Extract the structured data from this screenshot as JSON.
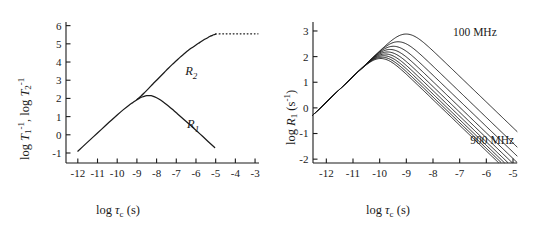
{
  "figure": {
    "type": "two-panel-scientific-plot",
    "background": "#ffffff",
    "line_color": "#1a1a1a"
  },
  "chart_data": [
    {
      "id": "left-panel",
      "type": "line",
      "title": "",
      "xlabel": "log τc (s)",
      "ylabel": "log T1-1, log T2-1",
      "xlim": [
        -12.6,
        -2.8
      ],
      "ylim": [
        -1.55,
        6.2
      ],
      "xticks": [
        -12,
        -11,
        -10,
        -9,
        -8,
        -7,
        -6,
        -5,
        -4,
        -3
      ],
      "xticklabels": [
        "-12",
        "-11",
        "-10",
        "-9",
        "-8",
        "-7",
        "-6",
        "-5",
        "-4",
        "-3"
      ],
      "yticks": [
        -1,
        0,
        1,
        2,
        3,
        4,
        5,
        6
      ],
      "yticklabels": [
        "-1",
        "0",
        "1",
        "2",
        "3",
        "4",
        "5",
        "6"
      ],
      "grid": false,
      "legend": "inline-annotations",
      "annotations": [
        {
          "text": "R2",
          "x": -6.55,
          "y": 3.28
        },
        {
          "text": "R1",
          "x": -6.45,
          "y": 0.35
        }
      ],
      "series": [
        {
          "name": "R1",
          "style": "solid",
          "x": [
            -12.0,
            -11.6,
            -11.2,
            -10.8,
            -10.4,
            -10.0,
            -9.7,
            -9.4,
            -9.2,
            -9.0,
            -8.9,
            -8.8,
            -8.7,
            -8.6,
            -8.5,
            -8.4,
            -8.3,
            -8.2,
            -8.0,
            -7.8,
            -7.6,
            -7.4,
            -7.2,
            -7.0,
            -6.6,
            -6.2,
            -5.8,
            -5.4,
            -5.05
          ],
          "y": [
            -0.9,
            -0.5,
            -0.1,
            0.3,
            0.7,
            1.09,
            1.37,
            1.63,
            1.78,
            1.93,
            1.99,
            2.05,
            2.09,
            2.13,
            2.15,
            2.16,
            2.15,
            2.13,
            2.04,
            1.91,
            1.75,
            1.58,
            1.4,
            1.21,
            0.83,
            0.44,
            0.05,
            -0.35,
            -0.7
          ]
        },
        {
          "name": "R2",
          "style": "solid",
          "x": [
            -9.0,
            -8.8,
            -8.6,
            -8.4,
            -8.2,
            -8.0,
            -7.8,
            -7.6,
            -7.4,
            -7.2,
            -7.0,
            -6.8,
            -6.6,
            -6.4,
            -6.2,
            -6.0,
            -5.8,
            -5.6,
            -5.45,
            -5.3,
            -5.2,
            -5.1,
            -5.0
          ],
          "y": [
            1.93,
            2.12,
            2.33,
            2.55,
            2.78,
            3.0,
            3.22,
            3.44,
            3.66,
            3.87,
            4.07,
            4.27,
            4.45,
            4.63,
            4.79,
            4.94,
            5.08,
            5.22,
            5.31,
            5.4,
            5.45,
            5.5,
            5.53
          ]
        },
        {
          "name": "R2-plateau",
          "style": "dotted",
          "x": [
            -5.0,
            -4.6,
            -4.2,
            -3.8,
            -3.4,
            -3.0,
            -2.85
          ],
          "y": [
            5.545,
            5.55,
            5.55,
            5.55,
            5.55,
            5.55,
            5.55
          ]
        }
      ]
    },
    {
      "id": "right-panel",
      "type": "line",
      "title": "",
      "xlabel": "log τc (s)",
      "ylabel": "log R1 (s-1)",
      "xlim": [
        -12.5,
        -4.85
      ],
      "ylim": [
        -2.15,
        3.35
      ],
      "xticks": [
        -12,
        -11,
        -10,
        -9,
        -8,
        -7,
        -6,
        -5
      ],
      "xticklabels": [
        "-12",
        "-11",
        "-10",
        "-9",
        "-8",
        "-7",
        "-6",
        "-5"
      ],
      "yticks": [
        -2,
        -1,
        0,
        1,
        2,
        3
      ],
      "yticklabels": [
        "-2",
        "-1",
        "0",
        "1",
        "2",
        "3"
      ],
      "grid": false,
      "legend": "inline-annotations",
      "annotations": [
        {
          "text": "100 MHz",
          "x": -7.25,
          "y": 2.8
        },
        {
          "text": "900 MHz",
          "x": -6.6,
          "y": -1.4
        }
      ],
      "frequencies_mhz": [
        100,
        200,
        300,
        400,
        500,
        600,
        700,
        800,
        900
      ],
      "series": [
        {
          "name": "100 MHz",
          "style": "solid",
          "peak_x": -8.0,
          "peak_y": 2.88
        },
        {
          "name": "200 MHz",
          "style": "solid",
          "peak_x": -8.3,
          "peak_y": 2.58
        },
        {
          "name": "300 MHz",
          "style": "solid",
          "peak_x": -8.48,
          "peak_y": 2.4
        },
        {
          "name": "400 MHz",
          "style": "solid",
          "peak_x": -8.6,
          "peak_y": 2.28
        },
        {
          "name": "500 MHz",
          "style": "solid",
          "peak_x": -8.7,
          "peak_y": 2.18
        },
        {
          "name": "600 MHz",
          "style": "solid",
          "peak_x": -8.78,
          "peak_y": 2.1
        },
        {
          "name": "700 MHz",
          "style": "solid",
          "peak_x": -8.84,
          "peak_y": 2.04
        },
        {
          "name": "800 MHz",
          "style": "solid",
          "peak_x": -8.9,
          "peak_y": 1.98
        },
        {
          "name": "900 MHz",
          "style": "solid",
          "peak_x": -8.95,
          "peak_y": 1.93
        }
      ]
    }
  ],
  "left": {
    "xlabel_parts": {
      "log": "log ",
      "tau": "τ",
      "sub": "c",
      "unit": " (s)"
    },
    "ylabel_parts": {
      "log1": "log ",
      "T1": "T",
      "T1sub": "1",
      "T1sup": "-1",
      "comma": ", log ",
      "T2": "T",
      "T2sub": "2",
      "T2sup": "-1"
    },
    "curve_labels": {
      "r2": "R",
      "r2sub": "2",
      "r1": "R",
      "r1sub": "1"
    }
  },
  "right": {
    "xlabel_parts": {
      "log": "log ",
      "tau": "τ",
      "sub": "c",
      "unit": " (s)"
    },
    "ylabel_parts": {
      "log": "log ",
      "R": "R",
      "Rsub": "1",
      "unit": " (s",
      "sup": "-1",
      "close": ")"
    },
    "annotations": {
      "high": "100 MHz",
      "low": "900 MHz"
    }
  }
}
